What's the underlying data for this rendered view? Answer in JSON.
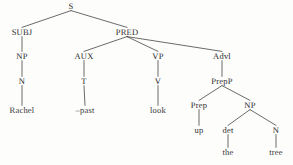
{
  "figure": {
    "kind": "syntax-tree",
    "sentence": "Rachel -past look up the tree",
    "ink_color": "#2b2b2b",
    "background_color": "#fdfdfc"
  },
  "nodes": [
    {
      "id": "s",
      "label": "S",
      "x": 71,
      "y": 6,
      "type": "category"
    },
    {
      "id": "subj",
      "label": "SUBJ",
      "x": 22,
      "y": 32,
      "type": "category"
    },
    {
      "id": "pred",
      "label": "PRED",
      "x": 127,
      "y": 32,
      "type": "category"
    },
    {
      "id": "np1",
      "label": "NP",
      "x": 22,
      "y": 56,
      "type": "category"
    },
    {
      "id": "aux",
      "label": "AUX",
      "x": 84,
      "y": 56,
      "type": "category"
    },
    {
      "id": "vp",
      "label": "VP",
      "x": 158,
      "y": 56,
      "type": "category"
    },
    {
      "id": "advl",
      "label": "Advl",
      "x": 222,
      "y": 56,
      "type": "category"
    },
    {
      "id": "n1",
      "label": "N",
      "x": 22,
      "y": 81,
      "type": "category"
    },
    {
      "id": "t",
      "label": "T",
      "x": 84,
      "y": 81,
      "type": "category"
    },
    {
      "id": "v",
      "label": "V",
      "x": 158,
      "y": 81,
      "type": "category"
    },
    {
      "id": "prepp",
      "label": "PrepP",
      "x": 222,
      "y": 81,
      "type": "category"
    },
    {
      "id": "rachel",
      "label": "Rachel",
      "x": 22,
      "y": 110,
      "type": "terminal"
    },
    {
      "id": "past",
      "label": "–past",
      "x": 85,
      "y": 110,
      "type": "terminal"
    },
    {
      "id": "look",
      "label": "look",
      "x": 158,
      "y": 110,
      "type": "terminal"
    },
    {
      "id": "prep",
      "label": "Prep",
      "x": 199,
      "y": 105,
      "type": "category"
    },
    {
      "id": "np2",
      "label": "NP",
      "x": 250,
      "y": 105,
      "type": "category"
    },
    {
      "id": "up",
      "label": "up",
      "x": 199,
      "y": 130,
      "type": "terminal"
    },
    {
      "id": "det",
      "label": "det",
      "x": 228,
      "y": 130,
      "type": "category"
    },
    {
      "id": "n2",
      "label": "N",
      "x": 276,
      "y": 130,
      "type": "category"
    },
    {
      "id": "the",
      "label": "the",
      "x": 228,
      "y": 152,
      "type": "terminal"
    },
    {
      "id": "tree",
      "label": "tree",
      "x": 276,
      "y": 152,
      "type": "terminal"
    }
  ],
  "edges": [
    {
      "from": "s",
      "to": "subj"
    },
    {
      "from": "s",
      "to": "pred"
    },
    {
      "from": "subj",
      "to": "np1"
    },
    {
      "from": "np1",
      "to": "n1"
    },
    {
      "from": "n1",
      "to": "rachel"
    },
    {
      "from": "pred",
      "to": "aux"
    },
    {
      "from": "pred",
      "to": "vp"
    },
    {
      "from": "pred",
      "to": "advl"
    },
    {
      "from": "aux",
      "to": "t"
    },
    {
      "from": "t",
      "to": "past"
    },
    {
      "from": "vp",
      "to": "v"
    },
    {
      "from": "v",
      "to": "look"
    },
    {
      "from": "advl",
      "to": "prepp"
    },
    {
      "from": "prepp",
      "to": "prep"
    },
    {
      "from": "prepp",
      "to": "np2"
    },
    {
      "from": "prep",
      "to": "up"
    },
    {
      "from": "np2",
      "to": "det"
    },
    {
      "from": "np2",
      "to": "n2"
    },
    {
      "from": "det",
      "to": "the"
    },
    {
      "from": "n2",
      "to": "tree"
    }
  ]
}
